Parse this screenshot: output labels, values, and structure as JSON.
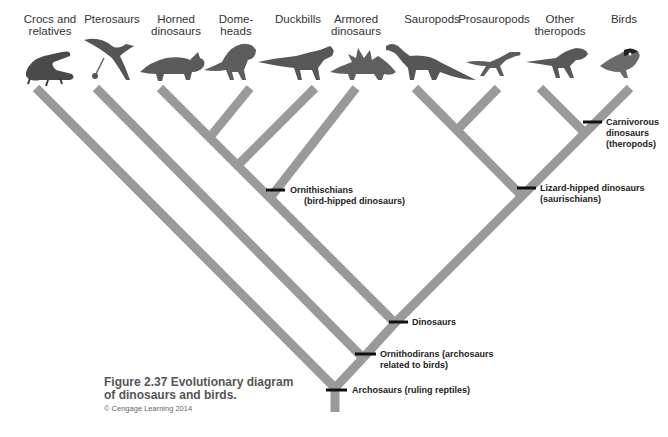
{
  "figure": {
    "number_title": "Figure 2.37 Evolutionary diagram of dinosaurs and birds.",
    "credit": "© Cengage Learning 2014"
  },
  "taxa": [
    {
      "label": "Crocs and relatives",
      "icon": "crocodile-icon",
      "x": 50
    },
    {
      "label": "Pterosaurs",
      "icon": "pterosaur-icon",
      "x": 115
    },
    {
      "label": "Horned dinosaurs",
      "icon": "triceratops-icon",
      "x": 180
    },
    {
      "label": "Dome-heads",
      "icon": "pachycephalosaur-icon",
      "x": 240
    },
    {
      "label": "Duckbills",
      "icon": "hadrosaur-icon",
      "x": 300
    },
    {
      "label": "Armored dinosaurs",
      "icon": "stegosaur-icon",
      "x": 355
    },
    {
      "label": "Sauropods",
      "icon": "sauropod-icon",
      "x": 425
    },
    {
      "label": "Prosauropods",
      "icon": "prosauropod-icon",
      "x": 490
    },
    {
      "label": "Other theropods",
      "icon": "theropod-icon",
      "x": 555
    },
    {
      "label": "Birds",
      "icon": "bird-icon",
      "x": 615
    }
  ],
  "nodes": [
    {
      "label": "Archosaurs (ruling reptiles)",
      "x": 335,
      "y": 388
    },
    {
      "label": "Ornithodirans (archosaurs related to birds)",
      "x": 363,
      "y": 358
    },
    {
      "label": "Dinosaurs",
      "x": 395,
      "y": 323
    },
    {
      "label": "Ornithischians (bird-hipped dinosaurs)",
      "x": 270,
      "y": 187
    },
    {
      "label": "Lizard-hipped dinosaurs (saurischians)",
      "x": 522,
      "y": 185
    },
    {
      "label": "Carnivorous dinosaurs (theropods)",
      "x": 585,
      "y": 122
    }
  ],
  "node_labels": {
    "archosaurs": "Archosaurs (ruling reptiles)",
    "ornithodirans_1": "Ornithodirans (archosaurs",
    "ornithodirans_2": "related to birds)",
    "dinosaurs": "Dinosaurs",
    "ornithischians_1": "Ornithischians",
    "ornithischians_2": "(bird-hipped dinosaurs)",
    "saurischians_1": "Lizard-hipped dinosaurs",
    "saurischians_2": "(saurischians)",
    "theropods_1": "Carnivorous",
    "theropods_2": "dinosaurs",
    "theropods_3": "(theropods)"
  },
  "taxon_labels": {
    "t0_1": "Crocs and",
    "t0_2": "relatives",
    "t1_1": "Pterosaurs",
    "t2_1": "Horned",
    "t2_2": "dinosaurs",
    "t3_1": "Dome-",
    "t3_2": "heads",
    "t4_1": "Duckbills",
    "t5_1": "Armored",
    "t5_2": "dinosaurs",
    "t6_1": "Sauropods",
    "t7_1": "Prosauropods",
    "t8_1": "Other",
    "t8_2": "theropods",
    "t9_1": "Birds"
  },
  "colors": {
    "branch": "#9a9a9a",
    "node_marker": "#111111",
    "caption": "#555555"
  }
}
